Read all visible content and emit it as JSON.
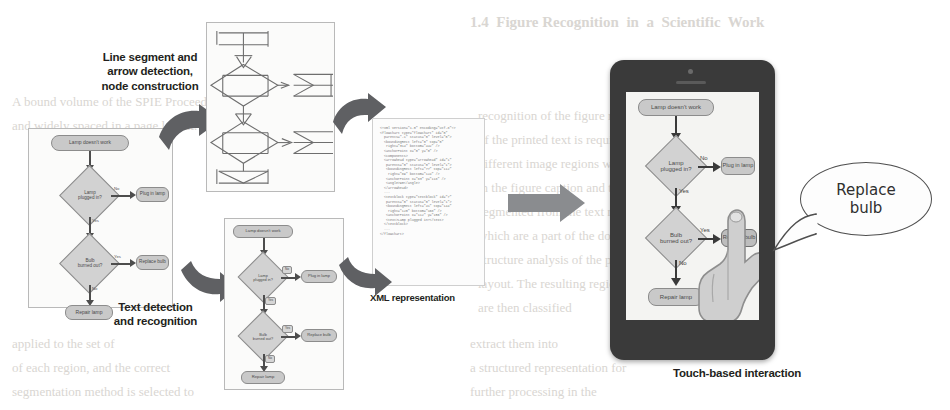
{
  "figure": {
    "accent_dark": "#3a3a3a",
    "node_fill": "#c9c9c9",
    "arrow_grey": "#5f6063"
  },
  "captions": {
    "line_detection": "Line segment and\narrow detection,\nnode construction",
    "text_detection": "Text detection\nand recognition",
    "xml_representation": "XML representation",
    "touch_interaction": "Touch-based interaction"
  },
  "flowchart": {
    "nodes": [
      {
        "id": "start",
        "type": "terminator",
        "label": "Lamp doesn't work"
      },
      {
        "id": "d1",
        "type": "decision",
        "label": "Lamp\nplugged in?"
      },
      {
        "id": "plug",
        "type": "process",
        "label": "Plug in lamp"
      },
      {
        "id": "d2",
        "type": "decision",
        "label": "Bulb\nburned out?"
      },
      {
        "id": "replace",
        "type": "process",
        "label": "Replace bulb"
      },
      {
        "id": "repair",
        "type": "process",
        "label": "Repair lamp"
      }
    ],
    "edges": [
      {
        "from": "start",
        "to": "d1",
        "label": ""
      },
      {
        "from": "d1",
        "to": "plug",
        "label": "No"
      },
      {
        "from": "d1",
        "to": "d2",
        "label": "Yes"
      },
      {
        "from": "d2",
        "to": "replace",
        "label": "Yes"
      },
      {
        "from": "d2",
        "to": "repair",
        "label": "No"
      }
    ],
    "labels": {
      "start": "Lamp doesn't work",
      "d1_line1": "Lamp",
      "d1_line2": "plugged in?",
      "plug": "Plug in lamp",
      "d2_line1": "Bulb",
      "d2_line2": "burned out?",
      "replace": "Replace bulb",
      "repair": "Repair lamp",
      "edge_no_1": "No",
      "edge_yes_1": "Yes",
      "edge_yes_2": "Yes",
      "edge_no_2": "No"
    }
  },
  "xml_code": {
    "lines": [
      "<?xml version=\"1.0\" encoding=\"utf-8\"?>",
      "<flowchart type=\"flowchart\" id=\"0\"",
      "  parents=\"-1\" status=\"0\" level=\"0\">",
      "  <boundingRect left=\"0\" top=\"0\"",
      "   right=\"314\" bottom=\"442\" />",
      "  <anchorPoint x=\"0\" y=\"0\" />",
      "  <components>",
      "  <arrowhead type=\"arrowhead\" id=\"1\"",
      "   parents=\"0\" status=\"0\" level=\"1\">",
      "   <boundingRect left=\"77\" top=\"112\"",
      "    right=\"89\" bottom=\"124\" />",
      "   <anchorPoint x=\"83\" y=\"118\" />",
      "   <angle>90</angle>",
      "  </arrowhead>",
      "  ...",
      "  <textblock type=\"textblock\" id=\"7\"",
      "   parents=\"0\" status=\"0\" level=\"1\">",
      "   <boundingRect left=\"41\" top=\"144\"",
      "    right=\"120\" bottom=\"168\" />",
      "   <anchorPoint x=\"112\" y=\"156\" />",
      "   <text>Lamp plugged in?</text>",
      "  </textblock>",
      "  ...",
      "</flowchart>"
    ]
  },
  "tablet": {
    "device": "tablet",
    "selected_node": "Replace bulb"
  },
  "speech_bubble": {
    "line1": "Replace",
    "line2": "bulb"
  },
  "ghost_text": {
    "items": [
      {
        "text": "1.4  Figure Recognition  in  a  Scientific  Work",
        "x": 470,
        "y": 14,
        "size": 15,
        "bold": true
      },
      {
        "text": "A bound volume of the SPIE Proceedings was used for",
        "x": 12,
        "y": 94,
        "size": 13,
        "bold": false
      },
      {
        "text": "and widely spaced in a page layout. A set of",
        "x": 12,
        "y": 118,
        "size": 13,
        "bold": false
      },
      {
        "text": "recognition of the figure regions in the",
        "x": 478,
        "y": 108,
        "size": 13,
        "bold": false
      },
      {
        "text": "of the printed text is required to resolve",
        "x": 478,
        "y": 132,
        "size": 13,
        "bold": false
      },
      {
        "text": "different image regions which can be",
        "x": 478,
        "y": 156,
        "size": 13,
        "bold": false
      },
      {
        "text": "in the figure caption and the body",
        "x": 478,
        "y": 180,
        "size": 13,
        "bold": false
      },
      {
        "text": "segmented from the text regions",
        "x": 478,
        "y": 204,
        "size": 13,
        "bold": false
      },
      {
        "text": "which are a part of the document",
        "x": 478,
        "y": 228,
        "size": 13,
        "bold": false
      },
      {
        "text": "structure analysis of the page",
        "x": 478,
        "y": 252,
        "size": 13,
        "bold": false
      },
      {
        "text": "layout. The resulting regions",
        "x": 478,
        "y": 276,
        "size": 13,
        "bold": false
      },
      {
        "text": "are then classified",
        "x": 478,
        "y": 300,
        "size": 13,
        "bold": false
      },
      {
        "text": "applied to the set of",
        "x": 12,
        "y": 336,
        "size": 13,
        "bold": false
      },
      {
        "text": "of each region, and the correct",
        "x": 12,
        "y": 360,
        "size": 13,
        "bold": false
      },
      {
        "text": "segmentation method is selected to",
        "x": 12,
        "y": 384,
        "size": 13,
        "bold": false
      },
      {
        "text": "extract them into",
        "x": 470,
        "y": 336,
        "size": 13,
        "bold": false
      },
      {
        "text": "a structured representation for",
        "x": 470,
        "y": 360,
        "size": 13,
        "bold": false
      },
      {
        "text": "further processing in the",
        "x": 470,
        "y": 384,
        "size": 13,
        "bold": false
      }
    ]
  }
}
